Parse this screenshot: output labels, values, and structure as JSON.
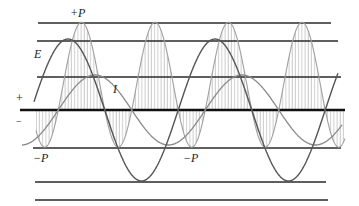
{
  "figure": {
    "labels": {
      "plus_p": "+P",
      "minus_p_left": "−P",
      "minus_p_mid": "−P",
      "voltage": "E",
      "current": "I",
      "plus_sign": "+",
      "minus_sign": "−"
    },
    "axis_y": 110,
    "gridlines_y": [
      23,
      41,
      77,
      148,
      182,
      200
    ],
    "curves": {
      "E": {
        "amplitude": 71,
        "period": 147,
        "peak_x": 68,
        "color": "#555555"
      },
      "I": {
        "amplitude": 35,
        "period": 147,
        "peak_x": 95,
        "color": "#888888"
      },
      "P": {
        "scale": 125,
        "color": "#9a9a9a",
        "hatch": "vertical"
      }
    },
    "colors": {
      "line": "#2a2a2a",
      "curve_e": "#555555",
      "curve_i": "#8a8a8a",
      "curve_p": "#a0a0a0"
    }
  }
}
